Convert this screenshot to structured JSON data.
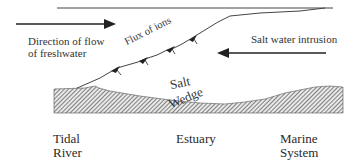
{
  "diagram": {
    "labels": {
      "freshwater_line1": "Direction of flow",
      "freshwater_line2": "of freshwater",
      "flux": "Flux of ions",
      "intrusion": "Salt water intrusion",
      "wedge_line1": "Salt",
      "wedge_line2": "Wedge"
    },
    "zones": [
      {
        "line1": "Tidal",
        "line2": "River"
      },
      {
        "line1": "Estuary",
        "line2": ""
      },
      {
        "line1": "Marine",
        "line2": "System"
      }
    ],
    "colors": {
      "line": "#333333",
      "hatch": "#555555",
      "background": "#ffffff"
    }
  }
}
